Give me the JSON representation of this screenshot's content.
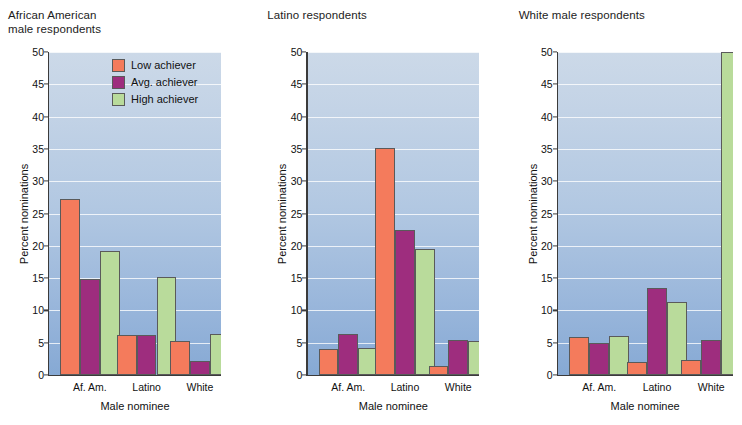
{
  "figure": {
    "background_color": "#ffffff",
    "plot_background_top": "#ccd9e8",
    "plot_background_bottom": "#86a9d4"
  },
  "legend": {
    "position": "top-center-of-first-panel",
    "entries": [
      {
        "label": "Low achiever",
        "color": "#F47B5C"
      },
      {
        "label": "Avg. achiever",
        "color": "#9E2D7E"
      },
      {
        "label": "High achiever",
        "color": "#B9DB9B"
      }
    ]
  },
  "axes": {
    "ylabel": "Percent nominations",
    "xlabel": "Male nominee",
    "yticks": [
      0,
      5,
      10,
      15,
      20,
      25,
      30,
      35,
      40,
      45,
      50
    ],
    "ylim": [
      0,
      50
    ],
    "categories": [
      "Af. Am.",
      "Latino",
      "White"
    ]
  },
  "chart_data": [
    {
      "type": "bar",
      "title": "African American\nmale respondents",
      "xlabel": "Male nominee",
      "ylabel": "Percent nominations",
      "ylim": [
        0,
        50
      ],
      "grid": true,
      "legend": "inside-top-center",
      "categories": [
        "Af. Am.",
        "Latino",
        "White"
      ],
      "series": [
        {
          "name": "Low achiever",
          "color": "#F47B5C",
          "values": [
            27.2,
            6.2,
            5.2
          ]
        },
        {
          "name": "Avg. achiever",
          "color": "#9E2D7E",
          "values": [
            14.9,
            6.2,
            2.2
          ]
        },
        {
          "name": "High achiever",
          "color": "#B9DB9B",
          "values": [
            19.2,
            15.2,
            6.3
          ]
        }
      ]
    },
    {
      "type": "bar",
      "title": "Latino respondents",
      "xlabel": "Male nominee",
      "ylabel": "Percent nominations",
      "ylim": [
        0,
        50
      ],
      "grid": true,
      "legend": "none",
      "categories": [
        "Af. Am.",
        "Latino",
        "White"
      ],
      "series": [
        {
          "name": "Low achiever",
          "color": "#F47B5C",
          "values": [
            4.0,
            35.1,
            1.4
          ]
        },
        {
          "name": "Avg. achiever",
          "color": "#9E2D7E",
          "values": [
            6.4,
            22.4,
            5.4
          ]
        },
        {
          "name": "High achiever",
          "color": "#B9DB9B",
          "values": [
            4.2,
            19.5,
            5.3
          ]
        }
      ]
    },
    {
      "type": "bar",
      "title": "White male respondents",
      "xlabel": "Male nominee",
      "ylabel": "Percent nominations",
      "ylim": [
        0,
        50
      ],
      "grid": true,
      "legend": "none",
      "categories": [
        "Af. Am.",
        "Latino",
        "White"
      ],
      "series": [
        {
          "name": "Low achiever",
          "color": "#F47B5C",
          "values": [
            5.9,
            2.0,
            2.3
          ]
        },
        {
          "name": "Avg. achiever",
          "color": "#9E2D7E",
          "values": [
            5.0,
            13.4,
            5.4
          ]
        },
        {
          "name": "High achiever",
          "color": "#B9DB9B",
          "values": [
            6.0,
            11.3,
            50.0
          ]
        }
      ]
    }
  ]
}
